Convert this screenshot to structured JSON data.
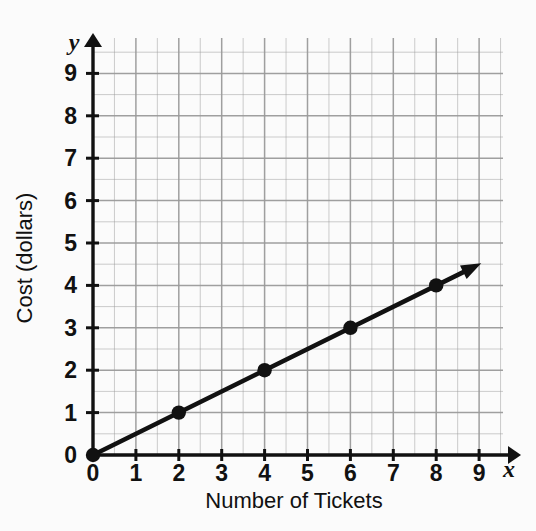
{
  "chart_data": {
    "type": "line",
    "title": "",
    "xlabel": "Number of Tickets",
    "ylabel": "Cost (dollars)",
    "x_axis_variable": "x",
    "y_axis_variable": "y",
    "xlim": [
      0,
      9.6
    ],
    "ylim": [
      0,
      9.6
    ],
    "x_ticks": [
      0,
      1,
      2,
      3,
      4,
      5,
      6,
      7,
      8,
      9
    ],
    "y_ticks": [
      0,
      1,
      2,
      3,
      4,
      5,
      6,
      7,
      8,
      9
    ],
    "x_tick_labels": [
      "0",
      "1",
      "2",
      "3",
      "4",
      "5",
      "6",
      "7",
      "8",
      "9"
    ],
    "y_tick_labels": [
      "0",
      "1",
      "2",
      "3",
      "4",
      "5",
      "6",
      "7",
      "8",
      "9"
    ],
    "grid": true,
    "grid_minor_step": 0.5,
    "grid_color": "#9a9a9a",
    "legend": false,
    "line_color": "#111111",
    "marker_color": "#111111",
    "series": [
      {
        "name": "Cost per tickets",
        "slope": 0.5,
        "intercept": 0,
        "line_start": [
          0,
          0
        ],
        "line_end": [
          9.05,
          4.52
        ],
        "arrow_at_end": true,
        "points": [
          {
            "x": 0,
            "y": 0
          },
          {
            "x": 2,
            "y": 1
          },
          {
            "x": 4,
            "y": 2
          },
          {
            "x": 6,
            "y": 3
          },
          {
            "x": 8,
            "y": 4
          }
        ]
      }
    ]
  },
  "labels": {
    "x_title": "Number of Tickets",
    "y_title": "Cost (dollars)",
    "x_var": "x",
    "y_var": "y"
  }
}
